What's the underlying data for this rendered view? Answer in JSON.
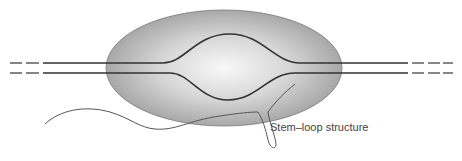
{
  "diagram": {
    "label": "Stem–loop structure",
    "colors": {
      "bubble_edge": "#8a8a8a",
      "bubble_center": "#f4f4f4",
      "strand": "#333333",
      "rna": "#555555"
    }
  }
}
